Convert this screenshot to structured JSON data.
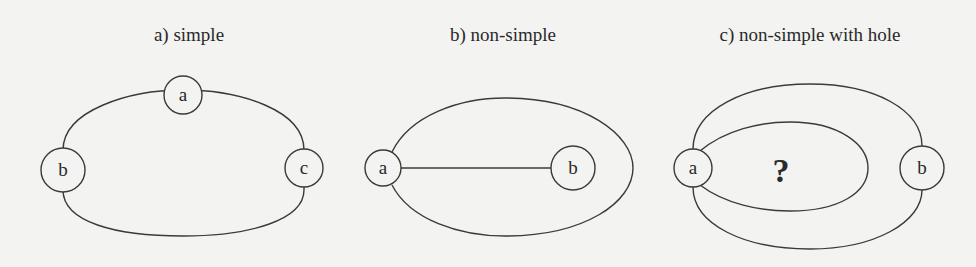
{
  "panels": [
    {
      "title": "a) simple",
      "nodes": [
        "a",
        "b",
        "c"
      ]
    },
    {
      "title": "b) non-simple",
      "nodes": [
        "a",
        "b"
      ]
    },
    {
      "title": "c) non-simple with hole",
      "nodes": [
        "a",
        "b"
      ],
      "hole_label": "?"
    }
  ],
  "colors": {
    "background": "#f3f3f1",
    "stroke": "#3a3a3a",
    "text": "#2a2a2a"
  }
}
